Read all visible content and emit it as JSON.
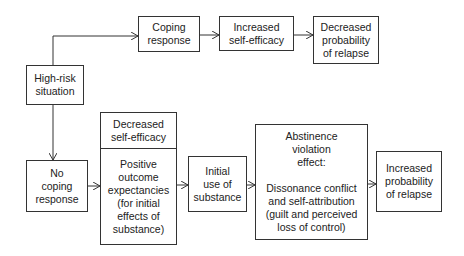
{
  "diagram": {
    "nodes": {
      "high_risk": "High-risk\nsituation",
      "coping": "Coping\nresponse",
      "increased_efficacy": "Increased\nself-efficacy",
      "decreased_prob": "Decreased\nprobability\nof relapse",
      "no_coping": "No\ncoping\nresponse",
      "decreased_efficacy": "Decreased\nself-efficacy",
      "positive_outcome": "Positive\noutcome\nexpectancies\n(for initial\neffects of\nsubstance)",
      "initial_use": "Initial\nuse of\nsubstance",
      "abstinence_violation": "Abstinence\nviolation\neffect:\n\nDissonance conflict\nand self-attribution\n(guilt and perceived\nloss of control)",
      "increased_prob": "Increased\nprobability\nof relapse"
    },
    "edges": [
      [
        "high_risk",
        "coping"
      ],
      [
        "coping",
        "increased_efficacy"
      ],
      [
        "increased_efficacy",
        "decreased_prob"
      ],
      [
        "high_risk",
        "no_coping"
      ],
      [
        "no_coping",
        "positive_outcome"
      ],
      [
        "positive_outcome",
        "initial_use"
      ],
      [
        "initial_use",
        "abstinence_violation"
      ],
      [
        "abstinence_violation",
        "increased_prob"
      ]
    ]
  }
}
